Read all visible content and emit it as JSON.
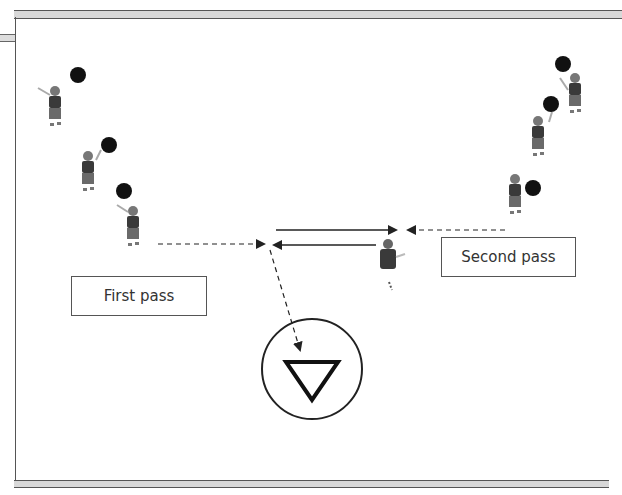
{
  "labels": {
    "first_pass": "First pass",
    "second_pass": "Second pass"
  },
  "colors": {
    "frame": "#555555",
    "ball": "#111111",
    "player_jersey": "#3a3a3a",
    "player_shorts": "#6a6a6a",
    "arrow": "#222222"
  },
  "players": {
    "left_line": [
      {
        "x": 55,
        "y": 105
      },
      {
        "x": 88,
        "y": 170
      },
      {
        "x": 133,
        "y": 225
      }
    ],
    "right_line": [
      {
        "x": 575,
        "y": 90
      },
      {
        "x": 538,
        "y": 135
      },
      {
        "x": 515,
        "y": 190
      }
    ],
    "middle": {
      "x": 388,
      "y": 260
    }
  },
  "balls": [
    {
      "x": 78,
      "y": 75
    },
    {
      "x": 109,
      "y": 145
    },
    {
      "x": 124,
      "y": 191
    },
    {
      "x": 563,
      "y": 64
    },
    {
      "x": 551,
      "y": 104
    },
    {
      "x": 533,
      "y": 188
    }
  ],
  "goal_icon": "inverted-triangle-in-circle"
}
